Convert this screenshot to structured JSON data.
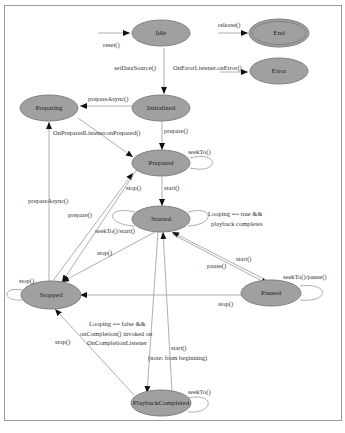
{
  "diagram": {
    "nodes": [
      {
        "id": "idle",
        "label": "Idle",
        "x": 161,
        "y": 33
      },
      {
        "id": "end",
        "label": "End",
        "x": 279,
        "y": 33
      },
      {
        "id": "error",
        "label": "Error",
        "x": 279,
        "y": 70
      },
      {
        "id": "preparing",
        "label": "Preparing",
        "x": 49,
        "y": 108
      },
      {
        "id": "initialized",
        "label": "Initialized",
        "x": 161,
        "y": 108
      },
      {
        "id": "prepared",
        "label": "Prepared",
        "x": 161,
        "y": 163
      },
      {
        "id": "started",
        "label": "Started",
        "x": 161,
        "y": 219
      },
      {
        "id": "stopped",
        "label": "Stopped",
        "x": 46,
        "y": 294
      },
      {
        "id": "paused",
        "label": "Paused",
        "x": 281,
        "y": 293
      },
      {
        "id": "playbackcompleted",
        "label": "PlaybackCompleted",
        "x": 161,
        "y": 406
      }
    ],
    "edge_labels": {
      "reset": "reset()",
      "release": "release()",
      "on_error": "OnErrorListener.onError()",
      "set_data_source": "setDataSource()",
      "prepare_async": "prepareAsync()",
      "prepare": "prepare()",
      "on_prepared": "OnPreparedListener.onPrepared()",
      "seek_to": "seekTo()",
      "start": "start()",
      "stop": "stop()",
      "prepare_async_stopped": "prepareAsync()",
      "prepare_stopped": "prepare()",
      "seek_start": "seekTo()/start()",
      "looping_true_1": "Looping == true &&",
      "looping_true_2": "playback completes",
      "stop_started": "stop()",
      "start_paused": "start()",
      "pause": "pause()",
      "seek_pause": "seekTo()/pause()",
      "stop_self": "stop()",
      "stop_paused": "stop()",
      "looping_false_1": "Looping == false &&",
      "looping_false_2": "onCompletion() invoked on",
      "looping_false_3": "OnCompletionListener",
      "start_pc_1": "start()",
      "start_pc_2": "(note: from beginning)",
      "stop_pc": "stop()",
      "seek_pc": "seekTo()"
    },
    "colors": {
      "node_fill": "#a0a0a0",
      "edge": "#999999",
      "border": "#9a9a9a"
    }
  }
}
